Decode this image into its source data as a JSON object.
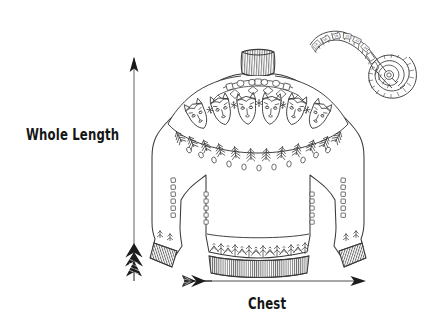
{
  "canvas": {
    "width": 428,
    "height": 335,
    "background": "#ffffff",
    "ink": "#3a3a3a",
    "ink_dark": "#151515",
    "arrow_line": "#8a8a8a"
  },
  "diagram": {
    "title_visible": false,
    "labels": [
      {
        "id": "whole-length",
        "text": "Whole Length",
        "orientation": "vertical-measure",
        "x": 26,
        "y": 128
      },
      {
        "id": "chest",
        "text": "Chest",
        "orientation": "horizontal-measure",
        "x": 248,
        "y": 297
      }
    ],
    "arrows": [
      {
        "id": "whole-length-arrow",
        "direction": "vertical",
        "head": "top",
        "fletching": "bottom",
        "x": 134,
        "y_top": 58,
        "y_bottom": 281,
        "color": "#8a8a8a"
      },
      {
        "id": "chest-arrow",
        "direction": "horizontal",
        "head": "right",
        "fletching": "left",
        "y": 281,
        "x_left": 182,
        "x_right": 366,
        "color": "#8a8a8a"
      }
    ],
    "objects": [
      {
        "id": "sweater",
        "name": "nordic-sweater",
        "description": "hand-drawn pullover sweater with turtleneck collar and patterned yoke",
        "motif": "fox-face",
        "motif_count": 6,
        "parts": [
          "turtleneck-collar",
          "patterned-yoke",
          "body",
          "left-sleeve",
          "right-sleeve",
          "ribbed-cuffs",
          "patterned-hem-band",
          "ribbed-hem"
        ],
        "bbox": {
          "x": 148,
          "y": 48,
          "width": 220,
          "height": 225
        }
      },
      {
        "id": "measuring-tape",
        "name": "measuring-tape",
        "description": "coiled cloth measuring tape with tick marks and numbers",
        "bbox": {
          "x": 305,
          "y": 25,
          "width": 105,
          "height": 80
        }
      }
    ]
  },
  "icons": {
    "arrow_head": "arrow-head-icon",
    "arrow_fletching": "arrow-fletching-icon",
    "tape": "measuring-tape-icon",
    "sweater": "sweater-icon"
  }
}
